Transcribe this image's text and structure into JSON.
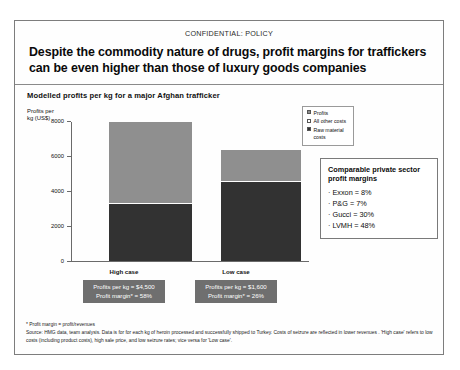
{
  "slide": {
    "classification": "CONFIDENTIAL: POLICY",
    "headline": "Despite the commodity nature of drugs, profit margins for traffickers can be even higher than those of luxury goods companies",
    "subtitle": "Modelled profits per kg for a major Afghan trafficker"
  },
  "legend": {
    "items": [
      {
        "label": "Profits",
        "swatch": "swatch-profits",
        "color": "#8f8f8f"
      },
      {
        "label": "All other costs",
        "swatch": "swatch-all-other-costs",
        "color": "#ffffff"
      },
      {
        "label": "Raw material costs",
        "swatch": "swatch-raw-material-costs",
        "color": "#323232"
      }
    ]
  },
  "compare_box": {
    "title": "Comparable private sector profit margins",
    "items": [
      "· Exxon = 8%",
      "· P&G = 7%",
      "· Gucci = 30%",
      "· LVMH = 48%"
    ]
  },
  "callouts": [
    {
      "line1": "Profits per kg = $4,500",
      "line2": "Profit margin* = 58%"
    },
    {
      "line1": "Profits per kg = $1,600",
      "line2": "Profit margin* = 26%"
    }
  ],
  "footnotes": {
    "margin_def": "* Profit margin = profit/revenues",
    "source": "Source: HMG data, team analysis. Data is for for each kg of heroin processed and successfully shipped to Turkey. Costs of seizure are reflected in lower revenues . 'High case' refers to low costs (including product costs), high sale price, and low seizure rates; vice versa for 'Low case'."
  },
  "chart_data": {
    "type": "bar",
    "subtype": "stacked",
    "title": "Modelled profits per kg for a major Afghan trafficker",
    "xlabel": "",
    "ylabel": "Profits per kg (US$)",
    "ylim": [
      0,
      8000
    ],
    "yticks": [
      0,
      2000,
      4000,
      6000,
      8000
    ],
    "ytick_labels": [
      "0",
      "2000",
      "4000",
      "6000",
      "8000"
    ],
    "grid": false,
    "legend_position": "top-right",
    "categories": [
      "High case",
      "Low case"
    ],
    "series": [
      {
        "name": "Raw material costs",
        "color": "#323232",
        "values": [
          3250,
          4500
        ]
      },
      {
        "name": "Profits",
        "color": "#8f8f8f",
        "values": [
          4650,
          1750
        ]
      }
    ],
    "totals": [
      7900,
      6250
    ],
    "annotations": [
      {
        "category": "High case",
        "profits_per_kg": "$4,500",
        "profit_margin": "58%"
      },
      {
        "category": "Low case",
        "profits_per_kg": "$1,600",
        "profit_margin": "26%"
      }
    ],
    "reference_margins": [
      {
        "name": "Exxon",
        "value": "8%"
      },
      {
        "name": "P&G",
        "value": "7%"
      },
      {
        "name": "Gucci",
        "value": "30%"
      },
      {
        "name": "LVMH",
        "value": "48%"
      }
    ]
  }
}
